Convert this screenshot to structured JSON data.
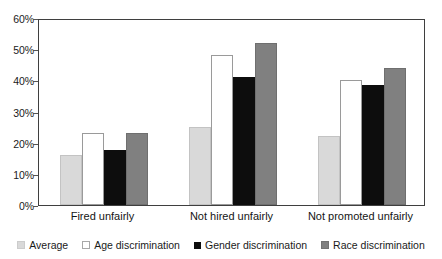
{
  "chart_data": {
    "type": "bar",
    "title": "",
    "subtitle": "",
    "xlabel": "",
    "ylabel": "",
    "ylim": [
      0,
      60
    ],
    "ytick_values": [
      0,
      10,
      20,
      30,
      40,
      50,
      60
    ],
    "ytick_labels": [
      "0%",
      "10%",
      "20%",
      "30%",
      "40%",
      "50%",
      "60%"
    ],
    "grid": false,
    "legend_position": "bottom",
    "categories": [
      "Fired unfairly",
      "Not hired unfairly",
      "Not promoted unfairly"
    ],
    "series": [
      {
        "name": "Average",
        "color": "#d9d9d9",
        "values": [
          16,
          25,
          22
        ]
      },
      {
        "name": "Age discrimination",
        "color": "#ffffff",
        "values": [
          23,
          48,
          40
        ]
      },
      {
        "name": "Gender discrimination",
        "color": "#0d0d0d",
        "values": [
          17.5,
          41,
          38.5
        ]
      },
      {
        "name": "Race discrimination",
        "color": "#808080",
        "values": [
          23,
          52,
          44
        ]
      }
    ]
  },
  "axis": {
    "y_tick_labels": [
      "60%",
      "50%",
      "40%",
      "30%",
      "20%",
      "10%",
      "0%"
    ]
  },
  "legend": {
    "items": [
      {
        "label": "Average",
        "series_key": "average"
      },
      {
        "label": "Age discrimination",
        "series_key": "age"
      },
      {
        "label": "Gender discrimination",
        "series_key": "gender"
      },
      {
        "label": "Race discrimination",
        "series_key": "race"
      }
    ]
  },
  "colors": {
    "average": "#d9d9d9",
    "age": "#ffffff",
    "gender": "#0d0d0d",
    "race": "#808080",
    "frame": "#3f3f3f",
    "text": "#1a1a1a",
    "background": "#ffffff"
  }
}
